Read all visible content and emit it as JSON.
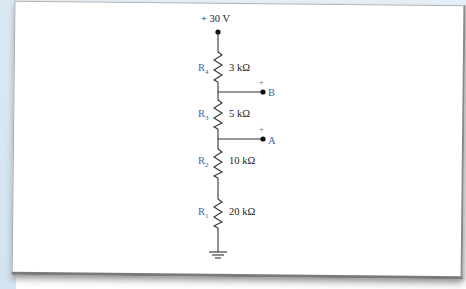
{
  "diagram": {
    "type": "voltage-divider circuit",
    "supply": {
      "label": "+ 30 V"
    },
    "resistors": [
      {
        "name": "R",
        "sub": "4",
        "value": "3 kΩ"
      },
      {
        "name": "R",
        "sub": "3",
        "value": "5 kΩ"
      },
      {
        "name": "R",
        "sub": "2",
        "value": "10 kΩ"
      },
      {
        "name": "R",
        "sub": "1",
        "value": "20 kΩ"
      }
    ],
    "terminals": [
      {
        "polarity": "+",
        "label": "B"
      },
      {
        "polarity": "+",
        "label": "A"
      }
    ],
    "ground": {
      "symbol": "ground"
    }
  },
  "colors": {
    "wire": "#333333",
    "resistor_label": "#3a6aa8",
    "value_text": "#222222",
    "background_tint": "#dbe9f3"
  }
}
